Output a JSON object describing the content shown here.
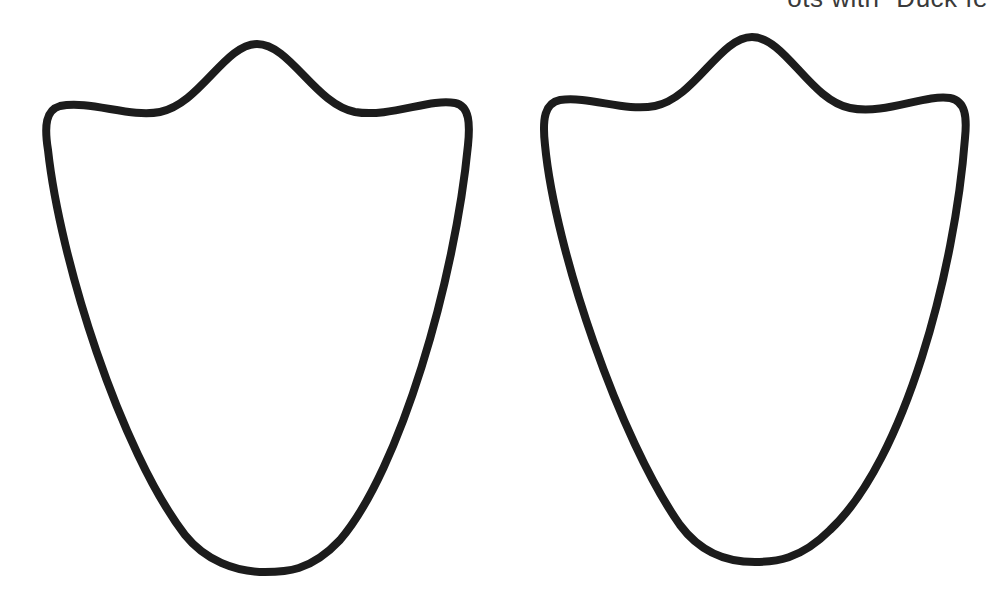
{
  "caption": {
    "text": "ots with “Duck fe"
  },
  "shapes": [
    {
      "name": "duck-foot-template-left",
      "label": "Duck foot outline (left)"
    },
    {
      "name": "duck-foot-template-right",
      "label": "Duck foot outline (right)"
    }
  ],
  "colors": {
    "background": "#ffffff",
    "outline": "#1c1c1c",
    "caption": "#3a3a3a"
  }
}
